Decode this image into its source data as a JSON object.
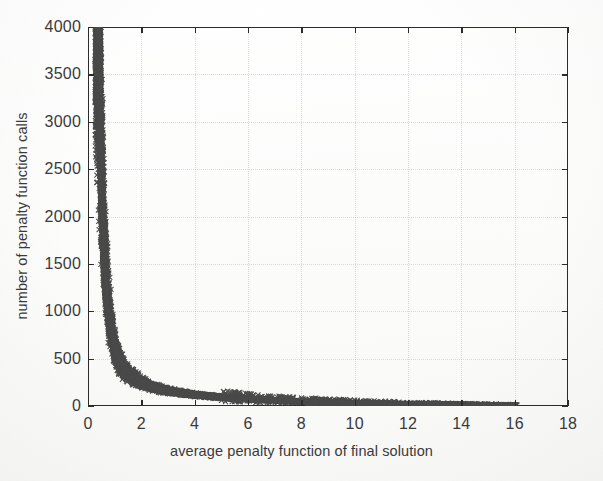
{
  "figure": {
    "kind": "scatter-plot-figure",
    "background_color": "#fdfdfc",
    "marker_color": "#4a4a4a",
    "axis_color": "#2b2b2b",
    "grid_color": "#b9b9b9"
  },
  "chart_data": {
    "type": "scatter",
    "title": "",
    "xlabel": "average penalty function of final solution",
    "ylabel": "number of penalty function calls",
    "xlim": [
      0,
      18
    ],
    "ylim": [
      0,
      4000
    ],
    "xticks": [
      0,
      2,
      4,
      6,
      8,
      10,
      12,
      14,
      16,
      18
    ],
    "xticklabels": [
      "0",
      "2",
      "4",
      "6",
      "8",
      "10",
      "12",
      "14",
      "16",
      "18"
    ],
    "yticks": [
      0,
      500,
      1000,
      1500,
      2000,
      2500,
      3000,
      3500,
      4000
    ],
    "yticklabels": [
      "0",
      "500",
      "1000",
      "1500",
      "2000",
      "2500",
      "3000",
      "3500",
      "4000"
    ],
    "grid": true,
    "grid_style": "dotted",
    "legend": null,
    "legend_position": "none",
    "marker": "x",
    "marker_size": 4,
    "series": [
      {
        "name": "penalty function calls vs average penalty",
        "description": "Dense inverse (hyperbolic) relationship: number of penalty function calls falls off sharply as the average penalty function of the final solution increases. A tall near-vertical band of points sits at x between about 0.35 and 0.75 spanning y from about 30 up to 4000, the curve knees near x=1 and y=700, then decays into a long flat tail that reaches y near 0 by x=8 with sparse isolated points extending to x=16.",
        "relation": "y = k / (x - x0), k approx 430, x0 approx 0.3",
        "point_count": 9000,
        "x_range": [
          0.33,
          16.1
        ],
        "y_range": [
          5,
          3990
        ],
        "representative_points": [
          [
            0.4,
            3980
          ],
          [
            0.4,
            3820
          ],
          [
            0.41,
            3700
          ],
          [
            0.42,
            3560
          ],
          [
            0.43,
            3420
          ],
          [
            0.44,
            3300
          ],
          [
            0.45,
            3180
          ],
          [
            0.46,
            3050
          ],
          [
            0.47,
            2930
          ],
          [
            0.48,
            2800
          ],
          [
            0.5,
            2650
          ],
          [
            0.51,
            2520
          ],
          [
            0.52,
            2400
          ],
          [
            0.54,
            2270
          ],
          [
            0.55,
            2150
          ],
          [
            0.57,
            2020
          ],
          [
            0.59,
            1900
          ],
          [
            0.61,
            1780
          ],
          [
            0.63,
            1650
          ],
          [
            0.65,
            1530
          ],
          [
            0.68,
            1400
          ],
          [
            0.71,
            1280
          ],
          [
            0.74,
            1150
          ],
          [
            0.78,
            1030
          ],
          [
            0.83,
            900
          ],
          [
            0.89,
            780
          ],
          [
            0.96,
            660
          ],
          [
            1.05,
            560
          ],
          [
            1.18,
            470
          ],
          [
            1.33,
            400
          ],
          [
            1.52,
            340
          ],
          [
            1.75,
            290
          ],
          [
            2.02,
            245
          ],
          [
            2.35,
            210
          ],
          [
            2.72,
            180
          ],
          [
            3.15,
            155
          ],
          [
            3.62,
            133
          ],
          [
            4.15,
            115
          ],
          [
            4.72,
            100
          ],
          [
            5.35,
            86
          ],
          [
            6.02,
            74
          ],
          [
            6.75,
            63
          ],
          [
            7.5,
            54
          ],
          [
            8.3,
            46
          ],
          [
            9.1,
            39
          ],
          [
            9.95,
            33
          ],
          [
            10.8,
            28
          ],
          [
            11.7,
            24
          ],
          [
            12.6,
            20
          ],
          [
            13.5,
            17
          ],
          [
            14.4,
            14
          ],
          [
            15.3,
            11
          ],
          [
            16.1,
            9
          ]
        ]
      }
    ]
  }
}
